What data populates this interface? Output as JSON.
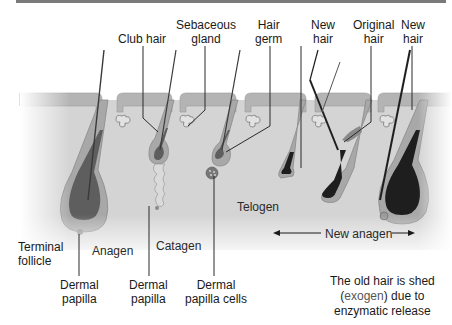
{
  "diagram": {
    "colors": {
      "top_rule": "#7a7a7a",
      "dermis": "#d4d4d4",
      "epidermis": "#b4b4b4",
      "sheath": "#a8a8a8",
      "bulb_dark": "#5e5e5e",
      "hair_shaft": "#1e1e1e",
      "leader_line": "#2a2a2a"
    },
    "top_labels": [
      {
        "id": "club-hair",
        "lines": [
          "Club hair"
        ]
      },
      {
        "id": "sebaceous-gland",
        "lines": [
          "Sebaceous",
          "gland"
        ]
      },
      {
        "id": "hair-germ",
        "lines": [
          "Hair",
          "germ"
        ]
      },
      {
        "id": "new-hair-1",
        "lines": [
          "New",
          "hair"
        ]
      },
      {
        "id": "original-hair",
        "lines": [
          "Original",
          "hair"
        ]
      },
      {
        "id": "new-hair-2",
        "lines": [
          "New",
          "hair"
        ]
      }
    ],
    "bottom_labels": [
      {
        "id": "terminal-follicle",
        "lines": [
          "Terminal",
          "follicle"
        ]
      },
      {
        "id": "dermal-papilla-1",
        "lines": [
          "Dermal",
          "papilla"
        ]
      },
      {
        "id": "dermal-papilla-2",
        "lines": [
          "Dermal",
          "papilla"
        ]
      },
      {
        "id": "dermal-papilla-cells",
        "lines": [
          "Dermal",
          "papilla cells"
        ]
      }
    ],
    "phases": {
      "anagen": "Anagen",
      "catagen": "Catagen",
      "telogen": "Telogen",
      "new_anagen": "New anagen"
    },
    "note": {
      "line1": "The old hair is shed",
      "line2_open": "(",
      "line2_highlight": "exogen",
      "line2_close": ") due to",
      "line3": "enzymatic release"
    }
  }
}
